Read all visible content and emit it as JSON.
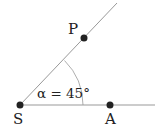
{
  "diagram": {
    "points": {
      "S": {
        "label": "S",
        "x": 20,
        "y": 105
      },
      "A": {
        "label": "A",
        "x": 110,
        "y": 105
      },
      "P": {
        "label": "P",
        "x": 84,
        "y": 38
      }
    },
    "angle": {
      "symbol": "α",
      "label": "α = 45°",
      "value_deg": 45
    },
    "colors": {
      "line": "#999999",
      "dot": "#222222",
      "text": "#222222"
    }
  }
}
